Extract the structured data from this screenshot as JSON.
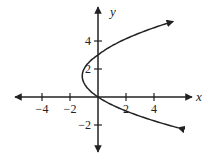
{
  "chart_data": {
    "type": "line",
    "title": "",
    "xlabel": "x",
    "ylabel": "y",
    "xlim": [
      -6.5,
      6.5
    ],
    "ylim": [
      -4,
      6.5
    ],
    "grid": false,
    "x_ticks": [
      -4,
      -2,
      2,
      4
    ],
    "y_ticks": [
      -2,
      2,
      4
    ],
    "x_tick_labels": [
      "−4",
      "−2",
      "2",
      "4"
    ],
    "y_tick_labels": [
      "−2",
      "2",
      "4"
    ],
    "series": [
      {
        "name": "x = (y² − 3y)/2",
        "description": "Sideways parabola opening right, vertex near (−1.1, 1.5), passing through (0,0), (0,3), (2,−1); arrows at both ends",
        "points": [
          {
            "x": 6.2,
            "y": -2.2
          },
          {
            "x": 5.0,
            "y": -2.0
          },
          {
            "x": 2.0,
            "y": -1.0
          },
          {
            "x": 0.0,
            "y": 0.0
          },
          {
            "x": -1.0,
            "y": 1.0
          },
          {
            "x": -1.125,
            "y": 1.5
          },
          {
            "x": -1.0,
            "y": 2.0
          },
          {
            "x": 0.0,
            "y": 3.0
          },
          {
            "x": 2.0,
            "y": 4.0
          },
          {
            "x": 5.0,
            "y": 5.4
          }
        ]
      }
    ],
    "color": "#222222"
  }
}
